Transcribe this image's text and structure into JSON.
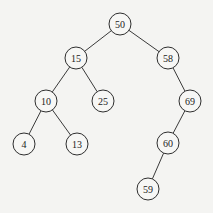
{
  "diagram": {
    "type": "binary-search-tree",
    "colors": {
      "background": "#f4f4f2",
      "node_fill": "#f7f7f5",
      "stroke": "#2e2e2e",
      "text": "#222222"
    },
    "node_radius": 11,
    "nodes": [
      {
        "id": "n50",
        "label": "50",
        "x": 120,
        "y": 24
      },
      {
        "id": "n15",
        "label": "15",
        "x": 76,
        "y": 58
      },
      {
        "id": "n58",
        "label": "58",
        "x": 168,
        "y": 58
      },
      {
        "id": "n10",
        "label": "10",
        "x": 46,
        "y": 101
      },
      {
        "id": "n25",
        "label": "25",
        "x": 103,
        "y": 101
      },
      {
        "id": "n69",
        "label": "69",
        "x": 190,
        "y": 101
      },
      {
        "id": "n4",
        "label": "4",
        "x": 24,
        "y": 144
      },
      {
        "id": "n13",
        "label": "13",
        "x": 77,
        "y": 144
      },
      {
        "id": "n60",
        "label": "60",
        "x": 168,
        "y": 143
      },
      {
        "id": "n59",
        "label": "59",
        "x": 148,
        "y": 189
      }
    ],
    "edges": [
      {
        "from": "n50",
        "to": "n15"
      },
      {
        "from": "n50",
        "to": "n58"
      },
      {
        "from": "n15",
        "to": "n10"
      },
      {
        "from": "n15",
        "to": "n25"
      },
      {
        "from": "n58",
        "to": "n69"
      },
      {
        "from": "n10",
        "to": "n4"
      },
      {
        "from": "n10",
        "to": "n13"
      },
      {
        "from": "n69",
        "to": "n60"
      },
      {
        "from": "n60",
        "to": "n59"
      }
    ]
  }
}
